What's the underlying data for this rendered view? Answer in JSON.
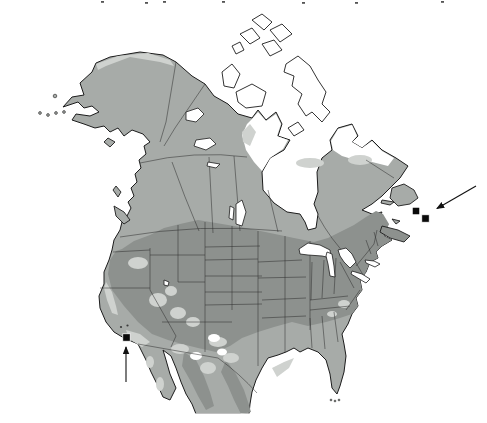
{
  "figure": {
    "kind": "species-distribution-map",
    "region": "North America",
    "colors": {
      "background": "#ffffff",
      "shade_medium": "#a7aba8",
      "shade_dark": "#8d918e",
      "shade_light": "#cfd2cf",
      "outline": "#1c1c1c",
      "marker": "#0a0a0a"
    },
    "markers": {
      "shape": "filled-square",
      "size": 7.5,
      "points": [
        {
          "id": "california-record",
          "x": 126.5,
          "y": 337.5
        },
        {
          "id": "atlantic-record-1",
          "x": 416.0,
          "y": 211.0
        },
        {
          "id": "atlantic-record-2",
          "x": 425.5,
          "y": 218.5
        }
      ],
      "specks": [
        {
          "x": 121.0,
          "y": 327.0
        },
        {
          "x": 127.5,
          "y": 325.5
        }
      ]
    },
    "arrows": [
      {
        "id": "arrow-california",
        "x1": 126,
        "y1": 382,
        "x2": 126,
        "y2": 347
      },
      {
        "id": "arrow-atlantic",
        "x1": 476,
        "y1": 186,
        "x2": 437,
        "y2": 208.5
      }
    ],
    "clipped_text_marks": [
      {
        "x": 101,
        "y": 1
      },
      {
        "x": 145,
        "y": 2
      },
      {
        "x": 163,
        "y": 1
      },
      {
        "x": 222,
        "y": 1
      },
      {
        "x": 302,
        "y": 2
      },
      {
        "x": 355,
        "y": 2
      },
      {
        "x": 441,
        "y": 1
      }
    ]
  }
}
